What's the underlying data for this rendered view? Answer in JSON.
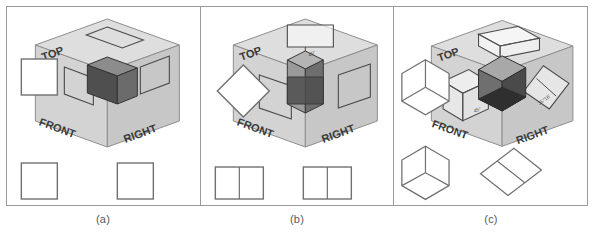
{
  "figure": {
    "width": 594,
    "height": 240,
    "background": "#ffffff",
    "border_color": "#9a9a9a"
  },
  "colors": {
    "border": "#9a9a9a",
    "line": "#5a5a5a",
    "thin_line": "#8d8d8d",
    "glass_top": "#dedede",
    "glass_front": "#d2d2d2",
    "glass_right": "#c6c6c6",
    "object_top": "#8c8c8c",
    "object_front": "#4f4f4f",
    "object_right": "#6e6e6e",
    "caption_text": "#58585a",
    "label_text": "#3a3a3a",
    "white": "#ffffff"
  },
  "panels": [
    {
      "id": "panel-a",
      "caption": "(a)",
      "glassbox": {
        "plane_labels": [
          "TOP",
          "FRONT",
          "RIGHT"
        ],
        "annotations": []
      },
      "object": {
        "name": "cube-aligned",
        "description": "cube aligned with glass box axes"
      },
      "views": [
        {
          "name": "top-view",
          "shape": "square",
          "divisions": 0
        },
        {
          "name": "front-view",
          "shape": "square",
          "divisions": 0
        },
        {
          "name": "right-view",
          "shape": "square",
          "divisions": 0
        }
      ]
    },
    {
      "id": "panel-b",
      "caption": "(b)",
      "glassbox": {
        "plane_labels": [
          "TOP",
          "FRONT",
          "RIGHT"
        ],
        "annotations": [
          "45°"
        ]
      },
      "object": {
        "name": "cube-rotated-45",
        "description": "cube rotated 45 degrees about vertical axis"
      },
      "views": [
        {
          "name": "top-view",
          "shape": "diamond",
          "divisions": 0
        },
        {
          "name": "front-view",
          "shape": "rectangle",
          "divisions": 1
        },
        {
          "name": "right-view",
          "shape": "rectangle",
          "divisions": 1
        }
      ]
    },
    {
      "id": "panel-c",
      "caption": "(c)",
      "glassbox": {
        "plane_labels": [
          "TOP",
          "FRONT",
          "RIGHT"
        ],
        "annotations": [
          "45°",
          "35°16'"
        ]
      },
      "object": {
        "name": "cube-isometric-tilted",
        "description": "cube rotated 45 degrees then tilted 35 degrees 16 minutes"
      },
      "views": [
        {
          "name": "top-view",
          "shape": "hexagon",
          "divisions": 3
        },
        {
          "name": "front-view",
          "shape": "hexagon",
          "divisions": 3
        },
        {
          "name": "right-view",
          "shape": "tilted-rectangle",
          "divisions": 1
        }
      ]
    }
  ]
}
